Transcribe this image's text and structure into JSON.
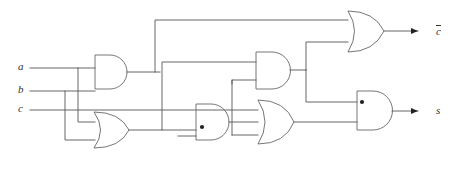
{
  "figure": {
    "kind": "logic-circuit-diagram",
    "title": "",
    "width": 454,
    "height": 176,
    "background_color": "#ffffff",
    "wire_color": "#555555",
    "gate_color": "#666666",
    "junction_color": "#222222"
  },
  "inputs": [
    {
      "id": "a",
      "label": "a",
      "x": 18,
      "y": 66,
      "wire_y": 68
    },
    {
      "id": "b",
      "label": "b",
      "x": 18,
      "y": 89,
      "wire_y": 91
    },
    {
      "id": "c",
      "label": "c",
      "x": 18,
      "y": 108,
      "wire_y": 110
    }
  ],
  "outputs": [
    {
      "id": "carry",
      "label": "c",
      "overbar": true,
      "x": 436,
      "y": 31,
      "wire_y": 31
    },
    {
      "id": "sum",
      "label": "s",
      "overbar": false,
      "x": 436,
      "y": 111,
      "wire_y": 111
    }
  ],
  "gates": [
    {
      "id": "g1",
      "type": "AND",
      "x": 95,
      "y": 55,
      "w": 32,
      "h": 34
    },
    {
      "id": "g2",
      "type": "OR",
      "x": 94,
      "y": 112,
      "w": 35,
      "h": 36
    },
    {
      "id": "g3",
      "type": "AND",
      "x": 196,
      "y": 104,
      "w": 32,
      "h": 36
    },
    {
      "id": "g4",
      "type": "AND",
      "x": 256,
      "y": 52,
      "w": 33,
      "h": 37
    },
    {
      "id": "g5",
      "type": "OR",
      "x": 258,
      "y": 100,
      "w": 36,
      "h": 44
    },
    {
      "id": "g6",
      "type": "OR",
      "x": 348,
      "y": 11,
      "w": 36,
      "h": 41
    },
    {
      "id": "g7",
      "type": "AND",
      "x": 357,
      "y": 91,
      "w": 34,
      "h": 39
    }
  ],
  "junctions": [
    {
      "id": "j1",
      "x": 202,
      "y": 127
    },
    {
      "id": "j2",
      "x": 362,
      "y": 102
    }
  ],
  "notes": {
    "description": "Two-level logic network with three inputs and two outputs"
  }
}
